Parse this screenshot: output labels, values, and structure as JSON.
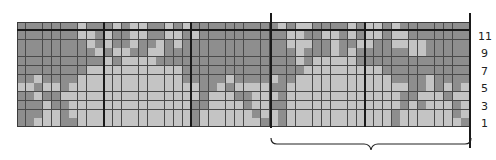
{
  "chart": {
    "columns": 52,
    "rows": 12,
    "colors": {
      "D": "#8e8e8e",
      "L": "#c4c4c4"
    },
    "pattern_top_to_bottom": [
      "DDDDDDDLDDDLDLLDDLDLDDDDDDDDDDLDLLDDDDLDLLDLDDDDDDDD",
      "DDDDDDDLLDLDDLLDDLLDLDDDDDDDDDDLLDDLLDLDLLDLLDDDDDDD",
      "DDDDDDDDLDLDDLDDLDLDDDDDDDDDDDDLLLDDLDDLLDDLLLLDDDDD",
      "DDDDDDDDDLDLLDDLLDDDDDDDDDDDDDDDLDDDLDLDDDDDDLLDDDDD",
      "DDDDDDDDDDLDLLLLDDDDDDDDDDDDDDDDLDLLLLLDDDDDDDDDDDDD",
      "DDDDDDDDLLLLLLLLLLLDDDDDDDDDDDDDDLLLLLLLLLDDDDDDDDDD",
      "DDLDDDDLLLLLLLLLLLLDDDDDLDDDDLDDLLLLLLLLLLLDDDDLDDDD",
      "LLDLLDLLLLLLLLLLLLLLLDDLDLLLLDDLLLLLLLLLLLLLLDDLDLDL",
      "DDLDDLLLLLLLLLLLLLLLLDLLLDDLLLDLLLLLLLLLLLLLDDLLLDLL",
      "DDDLDDLLLLLLLLLLLLLLDDLLLLDLLDDLLLLLLLLLLLLLDLDLLLDL",
      "DDDLLDLLLLLLLLLLLLLLDLLLLLLDLLDLLLLLLLLLLLLDLLLLLLDL",
      "DDLLLDDLLLLLLLLLLLLLDLLLLLLLDLDLLLLLLLLLLLLDLLLLLLLD"
    ],
    "row_labels": [
      "11",
      "9",
      "7",
      "5",
      "3",
      "1"
    ],
    "repeat_bracket": {
      "from_col": 30,
      "to_col": 52
    }
  }
}
